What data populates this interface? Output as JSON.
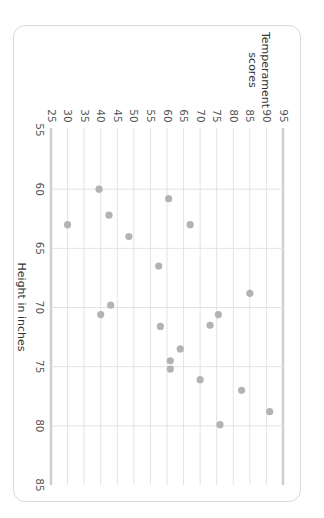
{
  "chart_data": {
    "type": "scatter",
    "title": "",
    "xlabel": "Height in inches",
    "ylabel": "Temperament scores",
    "xlim": [
      55,
      85
    ],
    "ylim": [
      25,
      95
    ],
    "x_ticks": [
      55,
      60,
      65,
      70,
      75,
      80,
      85
    ],
    "y_ticks": [
      25,
      30,
      35,
      40,
      45,
      50,
      55,
      60,
      65,
      70,
      75,
      80,
      85,
      90,
      95
    ],
    "grid": true,
    "legend": null,
    "orientation_note": "figure rotated 90 degrees clockwise",
    "series": [
      {
        "name": "Temperament vs Height",
        "color": "#b3b3b3",
        "points": [
          {
            "x": 60.0,
            "y": 39.5
          },
          {
            "x": 60.8,
            "y": 60.5
          },
          {
            "x": 62.2,
            "y": 42.5
          },
          {
            "x": 63.0,
            "y": 30.0
          },
          {
            "x": 63.0,
            "y": 67.0
          },
          {
            "x": 64.0,
            "y": 48.5
          },
          {
            "x": 66.5,
            "y": 57.5
          },
          {
            "x": 68.8,
            "y": 85.0
          },
          {
            "x": 69.8,
            "y": 43.0
          },
          {
            "x": 70.6,
            "y": 40.0
          },
          {
            "x": 70.6,
            "y": 75.5
          },
          {
            "x": 71.5,
            "y": 73.0
          },
          {
            "x": 71.6,
            "y": 58.0
          },
          {
            "x": 73.5,
            "y": 64.0
          },
          {
            "x": 74.5,
            "y": 61.0
          },
          {
            "x": 75.2,
            "y": 61.0
          },
          {
            "x": 76.1,
            "y": 70.0
          },
          {
            "x": 77.0,
            "y": 82.5
          },
          {
            "x": 78.8,
            "y": 91.0
          },
          {
            "x": 79.9,
            "y": 76.0
          }
        ]
      }
    ]
  },
  "labels": {
    "ylabel_line1": "Temperament",
    "ylabel_line2": "scores",
    "xlabel": "Height in inches"
  },
  "colors": {
    "grid": "#e3e3e3",
    "axis": "#cfcfcf",
    "dot": "#b3b3b3",
    "border": "#d9d9d9"
  }
}
